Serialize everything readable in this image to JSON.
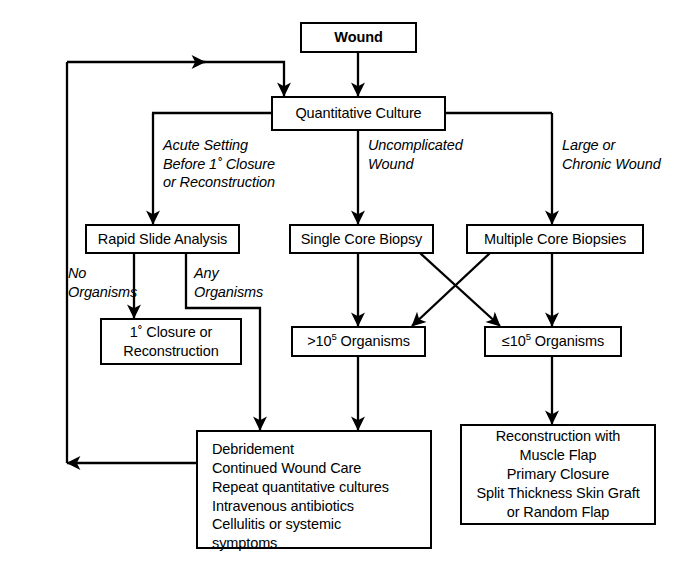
{
  "diagram": {
    "stroke_color": "#000000",
    "background_color": "#ffffff",
    "nodes": {
      "wound": {
        "label": "Wound"
      },
      "quantitative_culture": {
        "label": "Quantitative Culture"
      },
      "rapid_slide_analysis": {
        "label": "Rapid Slide Analysis"
      },
      "single_core_biopsy": {
        "label": "Single Core Biopsy"
      },
      "multiple_core_biopsies": {
        "label": "Multiple Core Biopsies"
      },
      "primary_closure": {
        "line1": "1˚ Closure or",
        "line2": "Reconstruction"
      },
      "high_organisms": {
        "prefix": ">10",
        "exponent": "5",
        "suffix": " Organisms"
      },
      "low_organisms": {
        "prefix": "≤10",
        "exponent": "5",
        "suffix": " Organisms"
      },
      "debridement": {
        "lines": [
          "Debridement",
          "Continued Wound Care",
          "Repeat quantitative cultures",
          "Intravenous antibiotics",
          "Cellulitis or systemic",
          "symptoms"
        ]
      },
      "reconstruction": {
        "lines": [
          "Reconstruction with",
          "Muscle Flap",
          "Primary Closure",
          "Split Thickness Skin Graft",
          "or Random Flap"
        ]
      }
    },
    "edge_labels": {
      "acute_setting": {
        "lines": [
          "Acute Setting",
          "Before 1˚ Closure",
          "or Reconstruction"
        ]
      },
      "uncomplicated_wound": {
        "lines": [
          "Uncomplicated",
          "Wound"
        ]
      },
      "large_chronic_wound": {
        "lines": [
          "Large or",
          "Chronic Wound"
        ]
      },
      "no_organisms": {
        "lines": [
          "No",
          "Organisms"
        ]
      },
      "any_organisms": {
        "lines": [
          "Any",
          "Organisms"
        ]
      }
    }
  }
}
